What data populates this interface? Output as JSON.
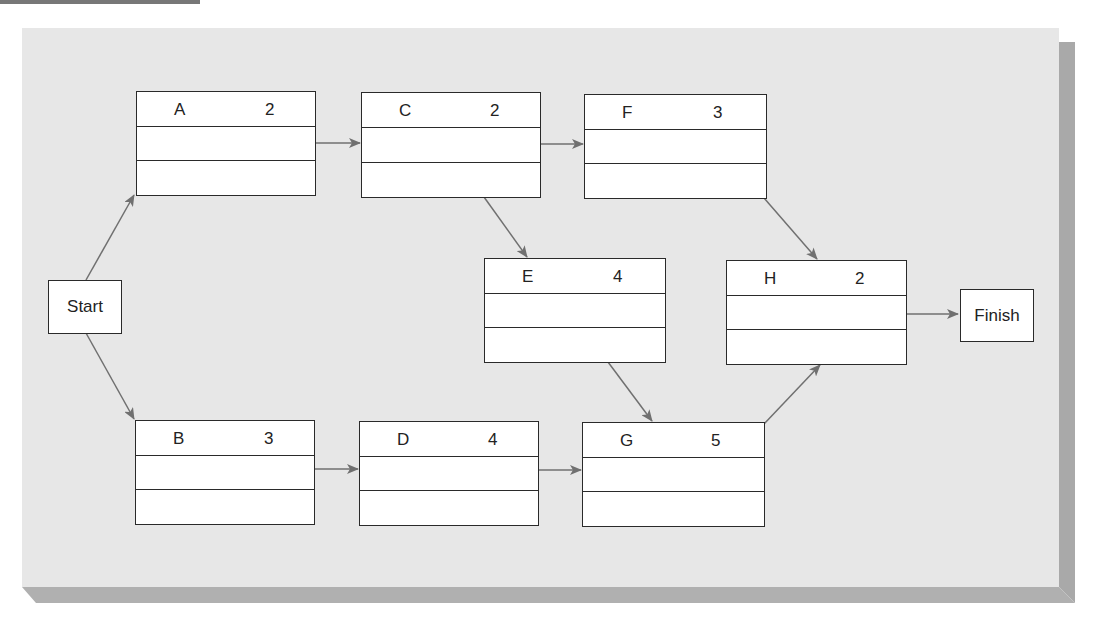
{
  "diagram": {
    "type": "activity-on-node network",
    "start_label": "Start",
    "finish_label": "Finish",
    "nodes": [
      {
        "id": "A",
        "label": "A",
        "duration": "2"
      },
      {
        "id": "B",
        "label": "B",
        "duration": "3"
      },
      {
        "id": "C",
        "label": "C",
        "duration": "2"
      },
      {
        "id": "D",
        "label": "D",
        "duration": "4"
      },
      {
        "id": "E",
        "label": "E",
        "duration": "4"
      },
      {
        "id": "F",
        "label": "F",
        "duration": "3"
      },
      {
        "id": "G",
        "label": "G",
        "duration": "5"
      },
      {
        "id": "H",
        "label": "H",
        "duration": "2"
      }
    ],
    "edges": [
      [
        "Start",
        "A"
      ],
      [
        "Start",
        "B"
      ],
      [
        "A",
        "C"
      ],
      [
        "C",
        "F"
      ],
      [
        "C",
        "E"
      ],
      [
        "B",
        "D"
      ],
      [
        "D",
        "G"
      ],
      [
        "E",
        "G"
      ],
      [
        "F",
        "H"
      ],
      [
        "G",
        "H"
      ],
      [
        "H",
        "Finish"
      ]
    ],
    "colors": {
      "panel": "#e7e7e7",
      "shadow": "#a9a9a9",
      "arrow": "#707070",
      "border": "#2a2a2a"
    }
  }
}
